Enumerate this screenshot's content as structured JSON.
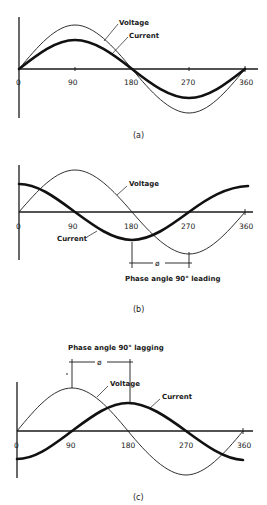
{
  "figure": {
    "panels": [
      {
        "id": "a",
        "caption": "(a)",
        "labels": {
          "voltage": "Voltage",
          "current": "Current"
        },
        "ticks": [
          "0",
          "90",
          "180",
          "270",
          "360"
        ],
        "description": "Voltage and current in phase"
      },
      {
        "id": "b",
        "caption": "(b)",
        "labels": {
          "voltage": "Voltage",
          "current": "Current"
        },
        "ticks": [
          "0",
          "90",
          "180",
          "270",
          "360"
        ],
        "phase_symbol": "ø",
        "phase_text": "Phase angle 90° leading",
        "description": "Current leads voltage by 90 degrees"
      },
      {
        "id": "c",
        "caption": "(c)",
        "labels": {
          "voltage": "Voltage",
          "current": "Current"
        },
        "ticks": [
          "0",
          "90",
          "180",
          "270",
          "360"
        ],
        "phase_symbol": "ø",
        "phase_text": "Phase angle 90° lagging",
        "description": "Current lags voltage by 90 degrees"
      }
    ],
    "colors": {
      "ink": "#1a1a1a",
      "background": "#ffffff"
    }
  }
}
